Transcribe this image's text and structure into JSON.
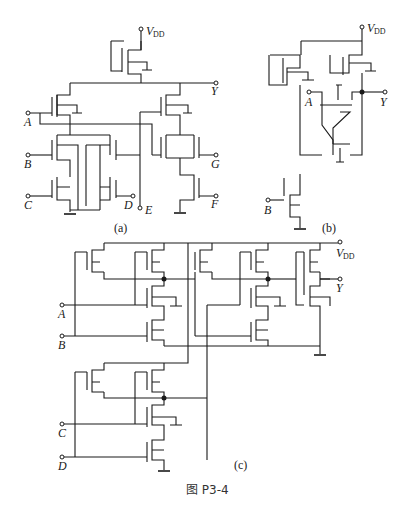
{
  "figure": {
    "caption": "图 P3-4",
    "panels": [
      {
        "id": "a",
        "label": "(a)",
        "inputs": [
          "A",
          "B",
          "C",
          "D",
          "E",
          "F",
          "G"
        ],
        "output": "Y",
        "supply": "V",
        "supply_sub": "DD"
      },
      {
        "id": "b",
        "label": "(b)",
        "inputs": [
          "A",
          "B"
        ],
        "output": "Y",
        "supply": "V",
        "supply_sub": "DD"
      },
      {
        "id": "c",
        "label": "(c)",
        "inputs": [
          "A",
          "B",
          "C",
          "D"
        ],
        "output": "Y",
        "supply": "V",
        "supply_sub": "DD"
      }
    ]
  }
}
